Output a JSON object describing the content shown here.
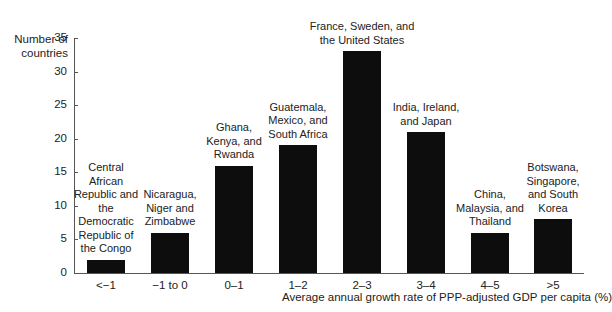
{
  "chart_data": {
    "type": "bar",
    "title": "",
    "xlabel": "Average annual growth rate of PPP-adjusted GDP per capita (%)",
    "ylabel": "Number of countries",
    "ylim": [
      0,
      35
    ],
    "yticks": [
      "0",
      "5",
      "10",
      "15",
      "20",
      "25",
      "30",
      "35"
    ],
    "categories": [
      "<−1",
      "−1 to 0",
      "0–1",
      "1–2",
      "2–3",
      "3–4",
      "4–5",
      ">5"
    ],
    "values": [
      2,
      6,
      16,
      19,
      33,
      21,
      6,
      8
    ],
    "annotations": [
      "Central African Republic and the Democratic Republic of the Congo",
      "Nicaragua, Niger and Zimbabwe",
      "Ghana, Kenya, and Rwanda",
      "Guatemala, Mexico, and South Africa",
      "France, Sweden, and the United States",
      "India, Ireland, and Japan",
      "China, Malaysia, and Thailand",
      "Botswana, Singapore, and South Korea"
    ],
    "grid": false,
    "legend": null,
    "bar_color": "#0d0d0d"
  },
  "labels": {
    "ylabel": "Number of countries",
    "xlabel": "Average annual growth rate of PPP-adjusted GDP per capita (%)"
  }
}
